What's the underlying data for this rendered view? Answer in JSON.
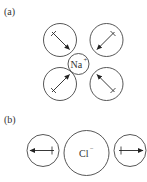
{
  "figure": {
    "panels": [
      {
        "id": "a",
        "label": "(a)",
        "central_ion": {
          "symbol": "Na",
          "charge": "+"
        },
        "solvent_molecules": [
          {
            "position": "upper-left",
            "dipole": "arrowhead-toward-ion"
          },
          {
            "position": "upper-right",
            "dipole": "arrowhead-toward-ion"
          },
          {
            "position": "lower-left",
            "dipole": "arrowhead-toward-ion"
          },
          {
            "position": "lower-right",
            "dipole": "arrowhead-toward-ion"
          }
        ]
      },
      {
        "id": "b",
        "label": "(b)",
        "central_ion": {
          "symbol": "Cl",
          "charge": "−"
        },
        "solvent_molecules": [
          {
            "position": "left",
            "dipole": "arrowhead-away-from-ion"
          },
          {
            "position": "right",
            "dipole": "arrowhead-away-from-ion"
          }
        ]
      }
    ],
    "colors": {
      "stroke": "#444444",
      "arrow": "#222222",
      "text": "#333333",
      "background": "#ffffff"
    }
  }
}
